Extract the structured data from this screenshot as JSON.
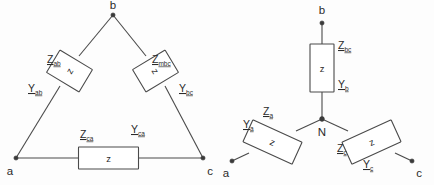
{
  "figure": {
    "background_color": "#fdfdfd",
    "line_color": "#4a4a4a",
    "text_color": "#2a2a2a",
    "element_box_letter": "z"
  },
  "delta": {
    "name": "delta-connection",
    "terminals": [
      {
        "id": "a",
        "label": "a"
      },
      {
        "id": "b",
        "label": "b"
      },
      {
        "id": "c",
        "label": "c"
      }
    ],
    "branches": [
      {
        "id": "ab",
        "impedance_symbol": "Z",
        "impedance_subscript": "ab",
        "admittance_symbol": "Y",
        "admittance_subscript": "ab",
        "box_letter": "z"
      },
      {
        "id": "bc",
        "impedance_symbol": "Z",
        "impedance_subscript": "mbc",
        "admittance_symbol": "Y",
        "admittance_subscript": "bc",
        "box_letter": "z"
      },
      {
        "id": "ca",
        "impedance_symbol": "Z",
        "impedance_subscript": "ca",
        "admittance_symbol": "Y",
        "admittance_subscript": "ca",
        "box_letter": "z"
      }
    ]
  },
  "wye": {
    "name": "wye-connection",
    "neutral_label": "N",
    "terminals": [
      {
        "id": "a",
        "label": "a"
      },
      {
        "id": "b",
        "label": "b"
      },
      {
        "id": "c",
        "label": "c"
      }
    ],
    "branches": [
      {
        "id": "a",
        "impedance_symbol": "Z",
        "impedance_subscript": "a",
        "admittance_symbol": "Y",
        "admittance_subscript": "a",
        "box_letter": "z"
      },
      {
        "id": "b",
        "impedance_symbol": "Z",
        "impedance_subscript": "bc",
        "admittance_symbol": "Y",
        "admittance_subscript": "b",
        "box_letter": "z"
      },
      {
        "id": "c",
        "impedance_symbol": "Z",
        "impedance_subscript": "c",
        "admittance_symbol": "Y",
        "admittance_subscript": "c",
        "box_letter": "z"
      }
    ]
  }
}
